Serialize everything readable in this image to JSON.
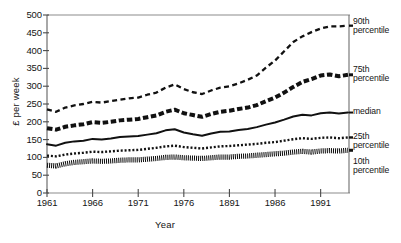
{
  "chart_data": {
    "type": "line",
    "title": "",
    "subtitle": "",
    "xlabel": "Year",
    "ylabel": "£ per week",
    "xlim": [
      1961,
      1994
    ],
    "ylim": [
      0,
      500
    ],
    "ytick_values": [
      0,
      50,
      100,
      150,
      200,
      250,
      300,
      350,
      400,
      450,
      500
    ],
    "ytick_labels": [
      "0",
      "50",
      "100",
      "150",
      "200",
      "250",
      "300",
      "350",
      "400",
      "450",
      "500"
    ],
    "xtick_values": [
      1961,
      1966,
      1971,
      1976,
      1981,
      1986,
      1991
    ],
    "xtick_labels": [
      "1961",
      "1966",
      "1971",
      "1976",
      "1891",
      "1986",
      "1991"
    ],
    "grid": false,
    "legend_position": "right-of-axes",
    "x": [
      1961,
      1962,
      1963,
      1964,
      1965,
      1966,
      1967,
      1968,
      1969,
      1970,
      1971,
      1972,
      1973,
      1974,
      1975,
      1976,
      1977,
      1978,
      1979,
      1980,
      1981,
      1982,
      1983,
      1984,
      1985,
      1986,
      1987,
      1988,
      1989,
      1990,
      1991,
      1992,
      1993,
      1994
    ],
    "series": [
      {
        "name": "90th percentile",
        "label": "90th\npercentile",
        "linestyle": "dashed",
        "color": "#111111",
        "values": [
          235,
          228,
          240,
          246,
          250,
          256,
          254,
          258,
          262,
          266,
          268,
          276,
          282,
          296,
          305,
          292,
          283,
          278,
          288,
          296,
          300,
          308,
          318,
          330,
          352,
          372,
          398,
          424,
          440,
          452,
          462,
          468,
          468,
          470
        ]
      },
      {
        "name": "75th percentile",
        "label": "75th\npercentile",
        "linestyle": "thick-dashed",
        "color": "#111111",
        "values": [
          182,
          178,
          186,
          190,
          193,
          199,
          197,
          200,
          204,
          206,
          208,
          213,
          218,
          228,
          234,
          224,
          219,
          214,
          222,
          228,
          231,
          236,
          240,
          247,
          258,
          268,
          282,
          298,
          312,
          320,
          330,
          333,
          328,
          332
        ]
      },
      {
        "name": "median",
        "label": "median",
        "linestyle": "solid",
        "color": "#111111",
        "values": [
          137,
          133,
          141,
          145,
          147,
          152,
          150,
          153,
          157,
          159,
          160,
          164,
          168,
          176,
          179,
          170,
          165,
          161,
          167,
          172,
          173,
          177,
          180,
          185,
          192,
          198,
          206,
          215,
          220,
          218,
          224,
          226,
          223,
          226
        ]
      },
      {
        "name": "25th percentile",
        "label": "25th\npercentile",
        "linestyle": "dotted",
        "color": "#111111",
        "values": [
          105,
          103,
          108,
          111,
          113,
          116,
          115,
          117,
          119,
          120,
          121,
          124,
          127,
          131,
          133,
          129,
          127,
          125,
          128,
          131,
          132,
          134,
          136,
          138,
          141,
          143,
          147,
          151,
          154,
          152,
          155,
          156,
          154,
          156
        ]
      },
      {
        "name": "10th percentile",
        "label": "10th\npercentile",
        "linestyle": "dense-hatched",
        "color": "#111111",
        "values": [
          78,
          76,
          82,
          86,
          88,
          90,
          89,
          90,
          92,
          93,
          93,
          95,
          97,
          100,
          101,
          99,
          98,
          97,
          99,
          101,
          101,
          103,
          104,
          106,
          108,
          110,
          112,
          115,
          117,
          115,
          118,
          119,
          118,
          120
        ]
      }
    ]
  },
  "axis": {
    "ylabel": "£ per week",
    "xlabel": "Year"
  }
}
